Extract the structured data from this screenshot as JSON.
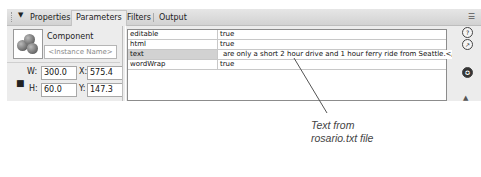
{
  "tabs": [
    {
      "label": "Properties",
      "active": false
    },
    {
      "label": "Parameters",
      "active": true
    },
    {
      "label": "Filters",
      "active": false
    },
    {
      "label": "Output",
      "active": false
    }
  ],
  "icons": {
    "collapse": "▼",
    "panel_menu": "☰",
    "help": "?",
    "code_assist": "↗",
    "component_inspector": "✪",
    "lock": "🔒",
    "collapse_up": "▲"
  },
  "component": {
    "label": "Component",
    "instance_name_placeholder": "<Instance Name>"
  },
  "dimensions": {
    "w_label": "W:",
    "w_value": "300.0",
    "h_label": "H:",
    "h_value": "60.0",
    "x_label": "X:",
    "x_value": "575.4",
    "y_label": "Y:",
    "y_value": "147.3"
  },
  "parameters": [
    {
      "name": "editable",
      "value": "true",
      "selected": false
    },
    {
      "name": "html",
      "value": "true",
      "selected": false
    },
    {
      "name": "text",
      "value": "are only a short 2 hour drive and 1 hour ferry ride from Seattle.</h3></b>",
      "selected": true
    },
    {
      "name": "wordWrap",
      "value": "true",
      "selected": false
    }
  ],
  "callout": {
    "line1": "Text from",
    "line2": "rosario.txt file"
  },
  "colors": {
    "panel_bg": "#ececec",
    "selected_row": "#d2d2d2",
    "callout_text": "#444444"
  }
}
